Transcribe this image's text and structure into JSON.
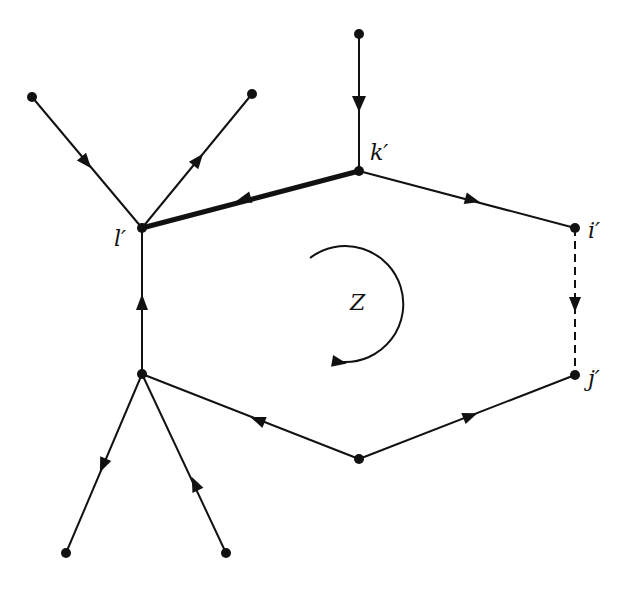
{
  "diagram": {
    "type": "directed-graph",
    "accent_color": "#111111",
    "labels": {
      "k": "k′",
      "l": "l′",
      "i": "i′",
      "j": "j′",
      "cycle": "Z"
    },
    "nodes": [
      {
        "id": "top",
        "x": 359,
        "y": 34
      },
      {
        "id": "k",
        "x": 359,
        "y": 171,
        "label": "k′"
      },
      {
        "id": "ul",
        "x": 32,
        "y": 97
      },
      {
        "id": "ur",
        "x": 252,
        "y": 94
      },
      {
        "id": "l",
        "x": 142,
        "y": 228,
        "label": "l′"
      },
      {
        "id": "i",
        "x": 575,
        "y": 228,
        "label": "i′"
      },
      {
        "id": "j",
        "x": 575,
        "y": 375,
        "label": "j′"
      },
      {
        "id": "m",
        "x": 142,
        "y": 374
      },
      {
        "id": "b",
        "x": 359,
        "y": 459
      },
      {
        "id": "bl",
        "x": 66,
        "y": 553
      },
      {
        "id": "br",
        "x": 226,
        "y": 553
      }
    ],
    "edges": [
      {
        "from": "top",
        "to": "k",
        "style": "solid"
      },
      {
        "from": "ul",
        "to": "l",
        "style": "solid"
      },
      {
        "from": "l",
        "to": "ur",
        "style": "solid"
      },
      {
        "from": "k",
        "to": "l",
        "style": "bold"
      },
      {
        "from": "k",
        "to": "i",
        "style": "solid"
      },
      {
        "from": "i",
        "to": "j",
        "style": "dashed"
      },
      {
        "from": "b",
        "to": "j",
        "style": "solid"
      },
      {
        "from": "b",
        "to": "m",
        "style": "solid"
      },
      {
        "from": "m",
        "to": "l",
        "style": "solid"
      },
      {
        "from": "m",
        "to": "bl",
        "style": "solid"
      },
      {
        "from": "br",
        "to": "m",
        "style": "solid"
      }
    ],
    "cycle_arrow": {
      "label": "Z",
      "direction": "clockwise",
      "center_x": 360,
      "center_y": 303
    }
  }
}
